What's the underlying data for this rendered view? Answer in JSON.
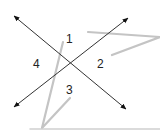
{
  "diagram": {
    "type": "intersecting-lines-angles",
    "lines": [
      {
        "name": "line-a",
        "from": [
          12,
          14
        ],
        "to": [
          128,
          111
        ],
        "arrows": "both"
      },
      {
        "name": "line-b",
        "from": [
          130,
          16
        ],
        "to": [
          12,
          109
        ],
        "arrows": "both"
      }
    ],
    "intersection": [
      70,
      62
    ],
    "angle_labels": [
      {
        "id": "1",
        "text": "1",
        "x": 70,
        "y": 43
      },
      {
        "id": "2",
        "text": "2",
        "x": 101,
        "y": 68
      },
      {
        "id": "3",
        "text": "3",
        "x": 69,
        "y": 93
      },
      {
        "id": "4",
        "text": "4",
        "x": 36,
        "y": 68
      }
    ],
    "scribbles": [
      {
        "points": "88,32 160,37 112,55"
      },
      {
        "points": "63,42 42,128"
      },
      {
        "points": "42,128 70,98"
      },
      {
        "points": "30,129 160,129"
      }
    ],
    "colors": {
      "line": "#333333",
      "label": "#222222",
      "scribble": "#c4c4c4",
      "background": "#ffffff"
    }
  }
}
